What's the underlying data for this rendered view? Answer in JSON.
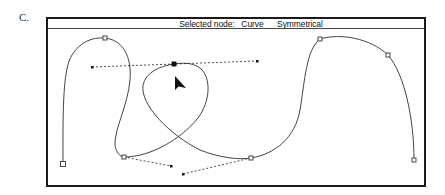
{
  "figure": {
    "label": "C."
  },
  "window": {
    "title_prefix": "Selected node:",
    "node_type": "Curve",
    "node_mode": "Symmetrical"
  },
  "drawing": {
    "curve_color": "#444444",
    "handle_color": "#222222",
    "nodes": [
      {
        "id": "n1",
        "x": 63,
        "y": 164,
        "selected": false
      },
      {
        "id": "n2",
        "x": 105,
        "y": 38,
        "selected": false
      },
      {
        "id": "n3",
        "x": 124,
        "y": 157,
        "selected": false
      },
      {
        "id": "n4",
        "x": 174,
        "y": 64,
        "selected": true
      },
      {
        "id": "n5",
        "x": 251,
        "y": 158,
        "selected": false
      },
      {
        "id": "n6",
        "x": 320,
        "y": 39,
        "selected": false
      },
      {
        "id": "n7",
        "x": 388,
        "y": 55,
        "selected": false
      },
      {
        "id": "n8",
        "x": 414,
        "y": 160,
        "selected": false
      }
    ],
    "handles": [
      {
        "from": "n4",
        "x": 92,
        "y": 67
      },
      {
        "from": "n4",
        "x": 257,
        "y": 61
      },
      {
        "from": "n3",
        "x": 171,
        "y": 166
      },
      {
        "from": "n5",
        "x": 183,
        "y": 174
      }
    ],
    "cursor": {
      "x": 175,
      "y": 76
    }
  }
}
